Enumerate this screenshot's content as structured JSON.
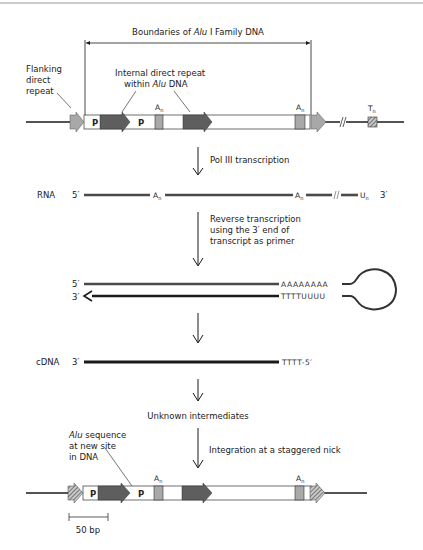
{
  "colors": {
    "line": "#1a1a1a",
    "light_arrow": "#a8a8a8",
    "dark_arrow": "#5e5e5e",
    "an_box": "#a9a9a9",
    "rna_line": "#4a4a4a",
    "hatch": "#6a6a6a"
  },
  "top_section": {
    "boundary_label_prefix": "Boundaries of ",
    "boundary_label_italic": "Alu",
    "boundary_label_suffix": " I Family DNA",
    "flanking_label": [
      "Flanking",
      "direct",
      "repeat"
    ],
    "internal_label_line1": "Internal direct repeat",
    "internal_label_line2_prefix": "within ",
    "internal_label_line2_italic": "Alu",
    "internal_label_line2_suffix": " DNA",
    "p1": "P",
    "p2": "P",
    "an1": "A",
    "an2": "A",
    "tn": "T",
    "subscript_n": "n"
  },
  "steps": {
    "pol3": "Pol III transcription",
    "reverse_transcription": [
      "Reverse transcription",
      "using the 3′ end of",
      "transcript as primer"
    ],
    "unknown": "Unknown intermediates",
    "integration": "Integration at a staggered nick"
  },
  "rna": {
    "label": "RNA",
    "five_prime": "5′",
    "three_prime": "3′",
    "a": "A",
    "u": "U",
    "n": "n"
  },
  "hairpin": {
    "top_end": "5′",
    "bottom_end": "3′",
    "top_seq": "AAAAAAAA",
    "bottom_seq": "TTTTUUUU"
  },
  "cdna": {
    "label": "cDNA",
    "three_prime": "3′",
    "tail": "TTTT-5′"
  },
  "bottom_section": {
    "alu_label_italic": "Alu",
    "alu_label_line1_suffix": " sequence",
    "alu_label_line2": "at new site",
    "alu_label_line3": "in DNA",
    "p1": "P",
    "p2": "P",
    "an1": "A",
    "an2": "A",
    "subscript_n": "n",
    "scale_bar": "50 bp"
  }
}
